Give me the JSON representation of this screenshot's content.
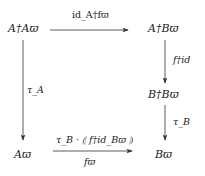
{
  "diagram": {
    "type": "commutative-square",
    "nodes": {
      "top_left": "A†Aϖ",
      "top_right": "A†Bϖ",
      "mid_right": "B†Bϖ",
      "bottom_left": "Aϖ",
      "bottom_right": "Bϖ"
    },
    "arrows": {
      "top": "id_A†fϖ",
      "right_upper": "f†id",
      "right_lower": "τ_B",
      "left": "τ_A",
      "bottom_above": "τ_B · ⦇ f†id_Bϖ ⦈",
      "bottom_below": "fϖ"
    }
  }
}
